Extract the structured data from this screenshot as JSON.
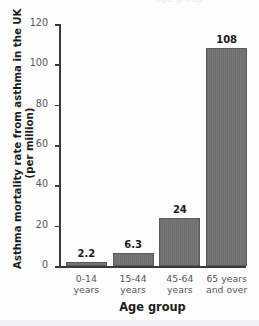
{
  "figure": {
    "clipped_title_fragment": "age group",
    "background_color": "#fefefe",
    "bar_color": "#6e6e6e",
    "axis_color": "#3a3a3a",
    "tick_label_color": "#54545a"
  },
  "chart_data": {
    "type": "bar",
    "title": "",
    "xlabel": "Age group",
    "ylabel": "Asthma mortality rate from asthma in the UK (per million)",
    "ylabel_line1": "Asthma mortality rate from asthma in the UK",
    "ylabel_line2": "(per million)",
    "categories": [
      "0-14 years",
      "15-44 years",
      "45-64 years",
      "65 years and over"
    ],
    "category_lines": [
      [
        "0-14",
        "years"
      ],
      [
        "15-44",
        "years"
      ],
      [
        "45-64",
        "years"
      ],
      [
        "65 years",
        "and over"
      ]
    ],
    "values": [
      2.2,
      6.3,
      24,
      108
    ],
    "value_labels": [
      "2.2",
      "6.3",
      "24",
      "108"
    ],
    "ylim": [
      0,
      120
    ],
    "yticks": [
      0,
      20,
      40,
      60,
      80,
      100,
      120
    ],
    "ytick_labels": [
      "0",
      "20",
      "40",
      "60",
      "80",
      "100",
      "120"
    ],
    "grid": false,
    "legend": null
  }
}
